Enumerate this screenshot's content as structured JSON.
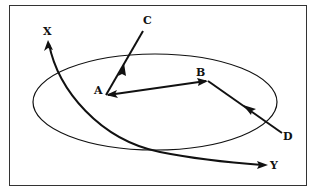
{
  "diagram": {
    "labels": {
      "A": "A",
      "B": "B",
      "C": "C",
      "D": "D",
      "X": "X",
      "Y": "Y"
    },
    "colors": {
      "stroke": "#111111",
      "frame": "#333333",
      "background": "#ffffff"
    },
    "elements": [
      {
        "type": "ellipse",
        "description": "oval region"
      },
      {
        "type": "arrow",
        "from": "A",
        "to": "C"
      },
      {
        "type": "arrow",
        "from": "B",
        "to": "A"
      },
      {
        "type": "arrow",
        "from": "A",
        "to": "B"
      },
      {
        "type": "arrow",
        "from": "D",
        "to": "B"
      },
      {
        "type": "curve-arrow",
        "ends": [
          "X",
          "Y"
        ]
      }
    ]
  }
}
